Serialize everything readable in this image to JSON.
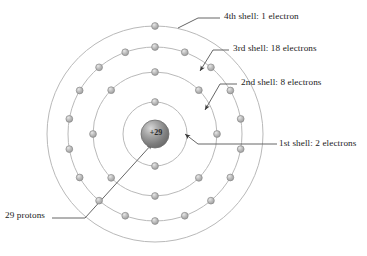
{
  "diagram": {
    "type": "bohr-atom-model",
    "nucleus": {
      "charge_label": "+29",
      "proton_count": 29,
      "center": {
        "x": 155,
        "y": 134
      },
      "radius": 14,
      "fill_color": "#8f8f8f",
      "highlight_color": "#cfcfcf"
    },
    "shell_stroke_color": "#b9b9b9",
    "electron_fill_color": "#b5b5b5",
    "electron_stroke_color": "#8a8a8a",
    "electron_radius": 3.4,
    "leader_color": "#555555",
    "shells": [
      {
        "index": 1,
        "name": "1st shell",
        "electron_count": 2,
        "radius": 32,
        "electron_angles": [
          -90,
          90
        ]
      },
      {
        "index": 2,
        "name": "2nd shell",
        "electron_count": 8,
        "radius": 62,
        "electron_angles": [
          -90,
          -45,
          0,
          45,
          90,
          135,
          180,
          225
        ]
      },
      {
        "index": 3,
        "name": "3rd shell",
        "electron_count": 18,
        "radius": 87,
        "electron_angles": [
          -90,
          -70,
          -50,
          -30,
          -10,
          10,
          30,
          50,
          70,
          90,
          110,
          130,
          150,
          170,
          190,
          210,
          230,
          250
        ]
      },
      {
        "index": 4,
        "name": "4th shell",
        "electron_count": 1,
        "radius": 108,
        "electron_angles": [
          -90
        ]
      }
    ],
    "labels": {
      "shell4": "4th shell: 1 electron",
      "shell3": "3rd shell: 18 electrons",
      "shell2": "2nd shell: 8 electrons",
      "shell1": "1st shell: 2 electrons",
      "protons": "29 protons"
    },
    "leaders": [
      {
        "name": "shell4",
        "points": "220,18 198,18 178,28",
        "arrow": false
      },
      {
        "name": "shell3",
        "points": "229,50 213,50 200,71",
        "arrow": true
      },
      {
        "name": "shell2",
        "points": "237,84 220,84 205,110",
        "arrow": true
      },
      {
        "name": "shell1",
        "points": "277,144 198,144 185,134",
        "arrow": true
      },
      {
        "name": "protons",
        "points": "52,218 85,218 152,144",
        "arrow": true
      }
    ]
  }
}
